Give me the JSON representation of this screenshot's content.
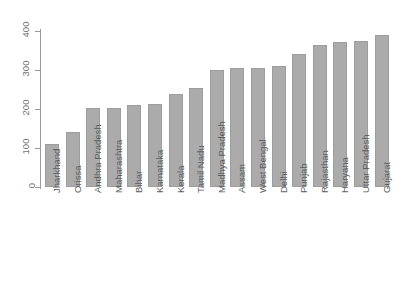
{
  "chart_data": {
    "type": "bar",
    "title": "",
    "subtitle": "",
    "xlabel": "",
    "ylabel": "",
    "ylim": [
      0,
      400
    ],
    "yticks": [
      0,
      100,
      200,
      300,
      400
    ],
    "ytick_labels": [
      "0",
      "100",
      "200",
      "300",
      "400"
    ],
    "grid": false,
    "legend": null,
    "orientation": "vertical",
    "bar_color": "#ababab",
    "bar_edge_color": "#9d9d9d",
    "background_color": "#ffffff",
    "axis_color": "#9a9a9a",
    "categories": [
      "Jharkhand",
      "Orissa",
      "Andhra Pradesh",
      "Maharashtra",
      "Bihar",
      "Karnataka",
      "Kerala",
      "Tamil Nadu",
      "Madhya Pradesh",
      "Assam",
      "West Bengal",
      "Delhi",
      "Punjab",
      "Rajasthan",
      "Haryana",
      "Uttar Pradesh",
      "Gujarat"
    ],
    "values": [
      110,
      140,
      202,
      203,
      210,
      212,
      238,
      253,
      300,
      305,
      305,
      310,
      340,
      365,
      372,
      375,
      390
    ]
  }
}
